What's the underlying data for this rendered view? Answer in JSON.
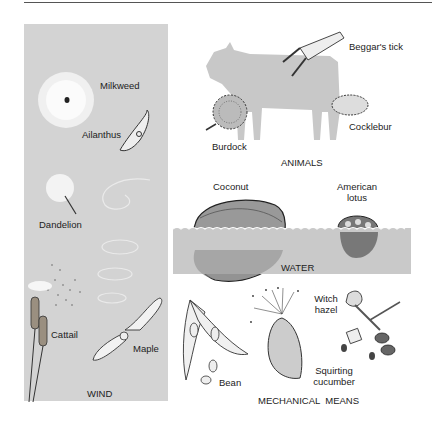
{
  "figure": {
    "colors": {
      "panel_gray": "#d3d3d3",
      "water_gray": "#c9c9c9",
      "silhouette_gray": "#c8c8c8",
      "ink": "#222222"
    }
  },
  "wind": {
    "section_label": "WIND",
    "items": [
      {
        "label": "Milkweed"
      },
      {
        "label": "Ailanthus"
      },
      {
        "label": "Dandelion"
      },
      {
        "label": "Cattail"
      },
      {
        "label": "Maple"
      }
    ]
  },
  "animals": {
    "section_label": "ANIMALS",
    "items": [
      {
        "label": "Beggar's tick"
      },
      {
        "label": "Burdock"
      },
      {
        "label": "Cocklebur"
      }
    ]
  },
  "water": {
    "section_label": "WATER",
    "items": [
      {
        "label": "Coconut"
      },
      {
        "label_line1": "American",
        "label_line2": "lotus"
      }
    ]
  },
  "mechanical": {
    "section_label": "MECHANICAL  MEANS",
    "items": [
      {
        "label": "Bean"
      },
      {
        "label_line1": "Squirting",
        "label_line2": "cucumber"
      },
      {
        "label_line1": "Witch",
        "label_line2": "hazel"
      }
    ]
  }
}
